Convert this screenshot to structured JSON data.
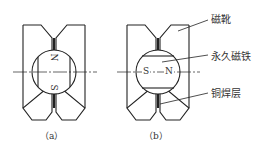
{
  "figure": {
    "a": {
      "caption": "（a）",
      "north": "N",
      "south": "S"
    },
    "b": {
      "caption": "（b）",
      "north": "N",
      "south": "S"
    },
    "labels": {
      "pole_shoe": "磁靴",
      "permanent_magnet": "永久磁铁",
      "braze_layer": "铜焊层"
    },
    "stroke_color": "#222222"
  }
}
